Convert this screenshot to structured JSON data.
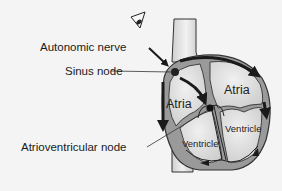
{
  "labels": {
    "autonomic_nerve": "Autonomic nerve",
    "sinus_node": "Sinus node",
    "atrioventricular_node": "Atrioventricular node"
  },
  "chambers": {
    "right_atrium": "Atria",
    "left_atrium": "Atria",
    "right_ventricle": "Ventricle",
    "left_ventricle": "Ventricle"
  },
  "colors": {
    "background": "#f4f4f4",
    "outline": "#333333",
    "heart_wall": "#9a9a9a",
    "chamber_fill": "#e2e2e2",
    "vessel_fill": "#e8e8e8",
    "arrow": "#1a1a1a",
    "text": "#1a1a1a"
  },
  "icons": [
    "eye-icon",
    "nerve-arrow-icon",
    "conduction-arrow-icon"
  ]
}
